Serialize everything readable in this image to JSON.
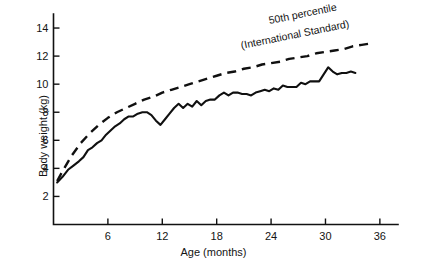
{
  "chart_data": {
    "type": "line",
    "title": "",
    "xlabel": "Age (months)",
    "ylabel": "Body weight (kg)",
    "xlim": [
      0,
      38
    ],
    "ylim": [
      0,
      15
    ],
    "xticks": [
      6,
      12,
      18,
      24,
      30,
      36
    ],
    "yticks": [
      2,
      4,
      6,
      8,
      10,
      12,
      14
    ],
    "grid": false,
    "legend_position": "inline-annotation",
    "annotations": [
      "50th percentile",
      "(International Standard)"
    ],
    "series": [
      {
        "name": "50th percentile (International Standard)",
        "style": "dashed",
        "x": [
          0.4,
          1,
          2,
          3,
          4,
          5,
          6,
          7,
          8,
          9,
          10,
          11,
          12,
          13,
          14,
          15,
          16,
          17,
          18,
          19,
          20,
          21,
          22,
          23,
          24,
          25,
          26,
          27,
          28,
          29,
          30,
          31,
          32,
          33,
          34,
          35
        ],
        "y": [
          3.1,
          3.8,
          4.9,
          5.8,
          6.5,
          7.1,
          7.6,
          8.0,
          8.3,
          8.6,
          8.9,
          9.1,
          9.4,
          9.6,
          9.8,
          10.0,
          10.2,
          10.4,
          10.6,
          10.8,
          10.9,
          11.1,
          11.2,
          11.4,
          11.5,
          11.6,
          11.8,
          11.9,
          12.0,
          12.2,
          12.3,
          12.4,
          12.5,
          12.7,
          12.8,
          12.9
        ]
      },
      {
        "name": "Observed child body weight",
        "style": "solid",
        "x": [
          0.4,
          1.0,
          1.6,
          2.2,
          2.8,
          3.3,
          3.8,
          4.3,
          4.8,
          5.3,
          5.8,
          6.3,
          6.8,
          7.3,
          7.8,
          8.3,
          8.8,
          9.3,
          9.8,
          10.3,
          10.8,
          11.3,
          11.8,
          12.3,
          12.8,
          13.3,
          13.8,
          14.3,
          14.8,
          15.3,
          15.8,
          16.3,
          16.8,
          17.3,
          17.8,
          18.3,
          18.8,
          19.3,
          19.8,
          20.3,
          20.8,
          21.3,
          21.8,
          22.3,
          22.8,
          23.3,
          23.8,
          24.3,
          24.8,
          25.3,
          25.8,
          26.3,
          26.8,
          27.3,
          27.8,
          28.3,
          28.8,
          29.3,
          29.8,
          30.3,
          30.8,
          31.3,
          31.8,
          32.3,
          32.8,
          33.3
        ],
        "y": [
          3.0,
          3.4,
          3.9,
          4.2,
          4.5,
          4.8,
          5.3,
          5.5,
          5.8,
          6.0,
          6.4,
          6.7,
          7.0,
          7.2,
          7.5,
          7.7,
          7.7,
          7.9,
          8.0,
          8.0,
          7.8,
          7.4,
          7.1,
          7.5,
          7.9,
          8.3,
          8.6,
          8.3,
          8.6,
          8.4,
          8.8,
          8.5,
          8.8,
          8.9,
          8.9,
          9.2,
          9.4,
          9.2,
          9.4,
          9.4,
          9.3,
          9.3,
          9.2,
          9.4,
          9.5,
          9.6,
          9.5,
          9.7,
          9.6,
          9.9,
          9.8,
          9.8,
          9.8,
          10.1,
          10.0,
          10.2,
          10.2,
          10.2,
          10.7,
          11.2,
          10.9,
          10.7,
          10.8,
          10.8,
          10.9,
          10.8
        ]
      }
    ]
  }
}
